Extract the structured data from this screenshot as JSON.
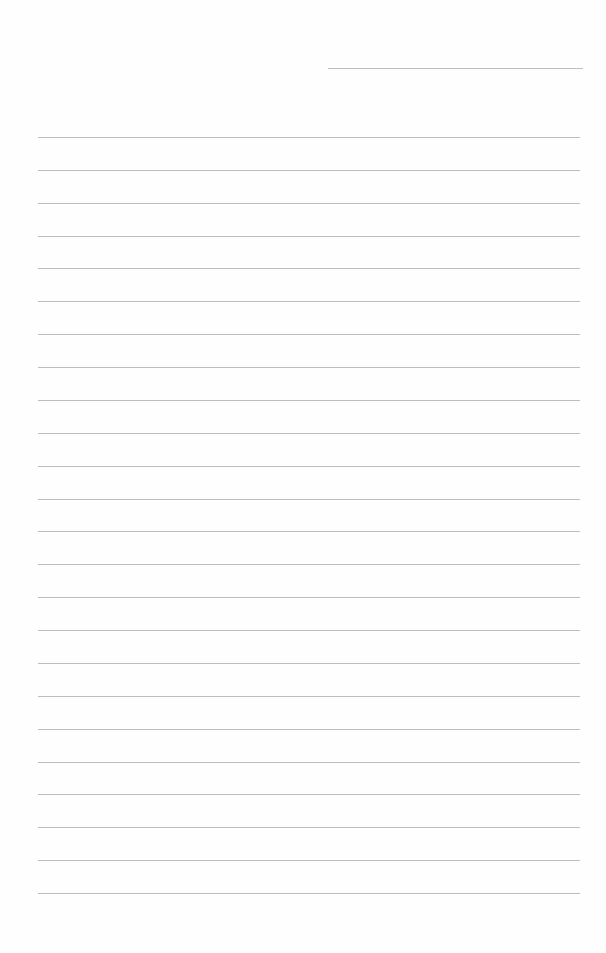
{
  "page": {
    "type": "lined-paper",
    "background_color": "#fefefe",
    "line_color": "#bdbdbd",
    "header_line": {
      "left": 328,
      "top": 68,
      "width": 255
    },
    "ruled_lines": {
      "count": 24,
      "left": 38,
      "width": 542,
      "first_top": 137,
      "spacing": 32.87
    }
  }
}
